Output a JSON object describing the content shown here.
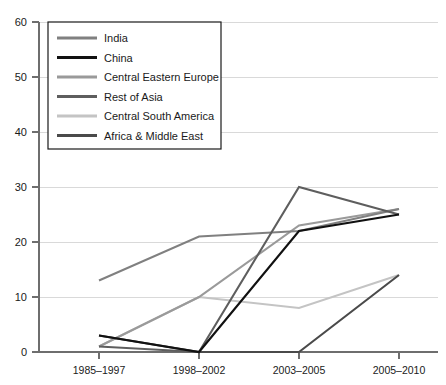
{
  "chart_data": {
    "type": "line",
    "title": "",
    "xlabel": "",
    "ylabel": "",
    "categories": [
      "1985–1997",
      "1998–2002",
      "2003–2005",
      "2005–2010"
    ],
    "ylim": [
      0,
      60
    ],
    "yticks": [
      0,
      10,
      20,
      30,
      40,
      50,
      60
    ],
    "ytick_labels": [
      "0",
      "10",
      "20",
      "30",
      "40",
      "50",
      "60"
    ],
    "grid": true,
    "legend_position": "top-left",
    "series": [
      {
        "name": "India",
        "color": "#808080",
        "values": [
          13,
          21,
          22,
          26
        ]
      },
      {
        "name": "China",
        "color": "#111111",
        "values": [
          3,
          0,
          22,
          25
        ]
      },
      {
        "name": "Central Eastern Europe",
        "color": "#9a9a9a",
        "values": [
          1,
          10,
          23,
          26
        ]
      },
      {
        "name": "Rest of Asia",
        "color": "#5e5e5e",
        "values": [
          1,
          0,
          30,
          25
        ]
      },
      {
        "name": "Central South America",
        "color": "#c4c4c4",
        "values": [
          1,
          10,
          8,
          14
        ]
      },
      {
        "name": "Africa & Middle East",
        "color": "#4a4a4a",
        "values": [
          3,
          0,
          0,
          14
        ]
      }
    ],
    "axis_color": "#6e6e6e",
    "grid_color": "#d9d9d9"
  },
  "legend": {
    "items": [
      {
        "label": "India"
      },
      {
        "label": "China"
      },
      {
        "label": "Central Eastern Europe"
      },
      {
        "label": "Rest of Asia"
      },
      {
        "label": "Central South America"
      },
      {
        "label": "Africa & Middle East"
      }
    ]
  },
  "ytick_text": {
    "t0": "0",
    "t1": "10",
    "t2": "20",
    "t3": "30",
    "t4": "40",
    "t5": "50",
    "t6": "60"
  },
  "xtick_text": {
    "t0": "1985–1997",
    "t1": "1998–2002",
    "t2": "2003–2005",
    "t3": "2005–2010"
  }
}
